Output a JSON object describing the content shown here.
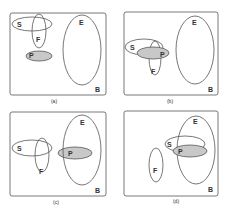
{
  "colors": {
    "stroke": "#555555",
    "fill_P": "#c8c8c8",
    "background": "#ffffff"
  },
  "panels": [
    {
      "caption": "(a)",
      "labels": {
        "S": "S",
        "F": "F",
        "P": "P",
        "E": "E",
        "B": "B"
      },
      "description": "S and F overlap; P separate; E separate"
    },
    {
      "caption": "(b)",
      "labels": {
        "S": "S",
        "F": "F",
        "P": "P",
        "E": "E",
        "B": "B"
      },
      "description": "S, F and P mutually overlap; E separate"
    },
    {
      "caption": "(c)",
      "labels": {
        "S": "S",
        "F": "F",
        "P": "P",
        "E": "E",
        "B": "B"
      },
      "description": "S and F overlap; P inside E"
    },
    {
      "caption": "(d)",
      "labels": {
        "S": "S",
        "F": "F",
        "P": "P",
        "E": "E",
        "B": "B"
      },
      "description": "F separate; S and P overlap, both overlapping E"
    }
  ]
}
